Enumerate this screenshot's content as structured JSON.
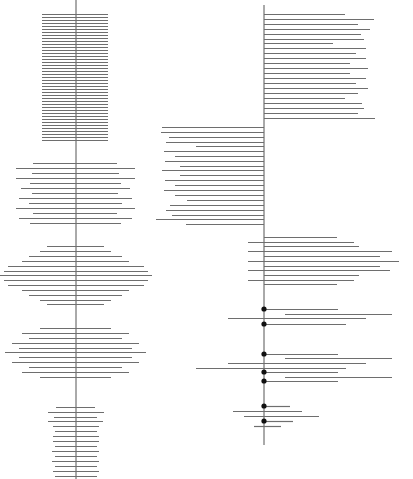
{
  "canvas": {
    "width": 413,
    "height": 479,
    "background": "#ffffff"
  },
  "colors": {
    "axis": "#555555",
    "line": "#6e6e6e",
    "dot": "#111111"
  },
  "left_panel": {
    "axis": {
      "x": 76,
      "y1": 0,
      "y2": 479
    },
    "groups": [
      {
        "name": "uniform-block",
        "lines": [
          [
            14,
            42,
            108
          ],
          [
            17,
            42,
            108
          ],
          [
            20,
            42,
            108
          ],
          [
            23,
            42,
            108
          ],
          [
            26,
            42,
            108
          ],
          [
            29,
            42,
            108
          ],
          [
            32,
            42,
            108
          ],
          [
            35,
            42,
            108
          ],
          [
            38,
            42,
            108
          ],
          [
            41,
            42,
            108
          ],
          [
            44,
            42,
            108
          ],
          [
            47,
            42,
            108
          ],
          [
            50,
            42,
            108
          ],
          [
            53,
            42,
            108
          ],
          [
            56,
            42,
            108
          ],
          [
            59,
            42,
            108
          ],
          [
            62,
            42,
            108
          ],
          [
            65,
            42,
            108
          ],
          [
            68,
            42,
            108
          ],
          [
            71,
            42,
            108
          ],
          [
            74,
            42,
            108
          ],
          [
            77,
            42,
            108
          ],
          [
            80,
            42,
            108
          ],
          [
            83,
            42,
            108
          ],
          [
            86,
            42,
            108
          ],
          [
            89,
            42,
            108
          ],
          [
            92,
            42,
            108
          ],
          [
            95,
            42,
            108
          ],
          [
            98,
            42,
            108
          ],
          [
            101,
            42,
            108
          ],
          [
            104,
            42,
            108
          ],
          [
            107,
            42,
            108
          ],
          [
            110,
            42,
            108
          ],
          [
            113,
            42,
            108
          ],
          [
            116,
            42,
            108
          ],
          [
            119,
            42,
            108
          ],
          [
            122,
            42,
            108
          ],
          [
            125,
            42,
            108
          ],
          [
            128,
            42,
            108
          ],
          [
            131,
            42,
            108
          ],
          [
            134,
            42,
            108
          ],
          [
            137,
            42,
            108
          ],
          [
            140,
            42,
            108
          ]
        ]
      },
      {
        "name": "ragged-block",
        "lines": [
          [
            163,
            33,
            117
          ],
          [
            168,
            16,
            135
          ],
          [
            173,
            32,
            119
          ],
          [
            178,
            16,
            135
          ],
          [
            183,
            30,
            121
          ],
          [
            188,
            21,
            130
          ],
          [
            193,
            32,
            118
          ],
          [
            198,
            19,
            132
          ],
          [
            203,
            29,
            122
          ],
          [
            208,
            16,
            135
          ],
          [
            213,
            33,
            117
          ],
          [
            218,
            19,
            132
          ],
          [
            223,
            30,
            121
          ]
        ]
      },
      {
        "name": "diamond-block",
        "lines": [
          [
            246,
            47,
            104
          ],
          [
            251,
            40,
            111
          ],
          [
            256,
            29,
            122
          ],
          [
            261,
            22,
            129
          ],
          [
            266,
            8,
            144
          ],
          [
            271,
            4,
            148
          ],
          [
            275,
            0,
            152
          ],
          [
            280,
            4,
            148
          ],
          [
            285,
            8,
            144
          ],
          [
            290,
            22,
            129
          ],
          [
            295,
            29,
            122
          ],
          [
            300,
            40,
            111
          ],
          [
            304,
            47,
            104
          ]
        ]
      },
      {
        "name": "ellipse-block",
        "lines": [
          [
            328,
            40,
            111
          ],
          [
            333,
            22,
            129
          ],
          [
            338,
            29,
            122
          ],
          [
            343,
            12,
            139
          ],
          [
            348,
            19,
            132
          ],
          [
            352,
            5,
            146
          ],
          [
            357,
            19,
            132
          ],
          [
            362,
            12,
            139
          ],
          [
            367,
            29,
            122
          ],
          [
            372,
            22,
            129
          ],
          [
            377,
            40,
            111
          ]
        ]
      },
      {
        "name": "narrow-block",
        "lines": [
          [
            407,
            56,
            95
          ],
          [
            412,
            48,
            104
          ],
          [
            417,
            54,
            97
          ],
          [
            421,
            48,
            103
          ],
          [
            426,
            53,
            99
          ],
          [
            431,
            55,
            97
          ],
          [
            436,
            53,
            99
          ],
          [
            441,
            53,
            99
          ],
          [
            446,
            55,
            97
          ],
          [
            451,
            52,
            99
          ],
          [
            456,
            55,
            97
          ],
          [
            461,
            52,
            99
          ],
          [
            466,
            55,
            97
          ],
          [
            471,
            53,
            99
          ],
          [
            476,
            55,
            97
          ]
        ]
      }
    ]
  },
  "right_panel": {
    "axis": {
      "x": 264,
      "y1": 5,
      "y2": 445
    },
    "groups": [
      {
        "name": "right-extending-block",
        "lines": [
          [
            14,
            264,
            345
          ],
          [
            19,
            264,
            374
          ],
          [
            24,
            264,
            358
          ],
          [
            29,
            264,
            370
          ],
          [
            34,
            264,
            361
          ],
          [
            39,
            264,
            364
          ],
          [
            43,
            264,
            333
          ],
          [
            48,
            264,
            366
          ],
          [
            53,
            264,
            356
          ],
          [
            58,
            264,
            366
          ],
          [
            63,
            264,
            350
          ],
          [
            68,
            264,
            368
          ],
          [
            73,
            264,
            350
          ],
          [
            78,
            264,
            366
          ],
          [
            83,
            264,
            356
          ],
          [
            88,
            264,
            368
          ],
          [
            93,
            264,
            358
          ],
          [
            98,
            264,
            345
          ],
          [
            103,
            264,
            362
          ],
          [
            108,
            264,
            364
          ],
          [
            113,
            264,
            358
          ],
          [
            118,
            264,
            375
          ]
        ]
      },
      {
        "name": "left-extending-block",
        "lines": [
          [
            127,
            162,
            264
          ],
          [
            132,
            161,
            264
          ],
          [
            137,
            169,
            264
          ],
          [
            142,
            166,
            264
          ],
          [
            146,
            196,
            264
          ],
          [
            151,
            164,
            264
          ],
          [
            156,
            175,
            264
          ],
          [
            161,
            165,
            264
          ],
          [
            166,
            180,
            264
          ],
          [
            170,
            162,
            264
          ],
          [
            175,
            180,
            264
          ],
          [
            180,
            165,
            264
          ],
          [
            185,
            175,
            264
          ],
          [
            190,
            164,
            264
          ],
          [
            195,
            175,
            264
          ],
          [
            200,
            187,
            264
          ],
          [
            205,
            170,
            264
          ],
          [
            210,
            166,
            264
          ],
          [
            215,
            172,
            264
          ],
          [
            219,
            156,
            264
          ],
          [
            224,
            186,
            264
          ]
        ]
      },
      {
        "name": "mixed-block",
        "lines": [
          [
            237,
            264,
            337
          ],
          [
            242,
            248,
            354
          ],
          [
            246,
            264,
            359
          ],
          [
            251,
            248,
            392
          ],
          [
            256,
            264,
            380
          ],
          [
            261,
            248,
            399
          ],
          [
            266,
            264,
            380
          ],
          [
            270,
            248,
            390
          ],
          [
            275,
            264,
            359
          ],
          [
            280,
            248,
            354
          ],
          [
            284,
            264,
            337
          ]
        ]
      },
      {
        "name": "dotted-block",
        "lines": [
          [
            309,
            264,
            338
          ],
          [
            314,
            285,
            392
          ],
          [
            318,
            228,
            366
          ],
          [
            324,
            264,
            346
          ],
          [
            354,
            264,
            338
          ],
          [
            358,
            285,
            392
          ],
          [
            363,
            228,
            366
          ],
          [
            368,
            196,
            346
          ],
          [
            372,
            264,
            338
          ],
          [
            377,
            285,
            392
          ],
          [
            381,
            264,
            338
          ],
          [
            406,
            264,
            290
          ],
          [
            411,
            233,
            302
          ],
          [
            416,
            244,
            319
          ],
          [
            421,
            264,
            293
          ],
          [
            426,
            254,
            281
          ]
        ],
        "dots": [
          [
            264,
            309
          ],
          [
            264,
            324
          ],
          [
            264,
            354
          ],
          [
            264,
            372
          ],
          [
            264,
            381
          ],
          [
            264,
            406
          ],
          [
            264,
            421
          ]
        ]
      }
    ]
  }
}
